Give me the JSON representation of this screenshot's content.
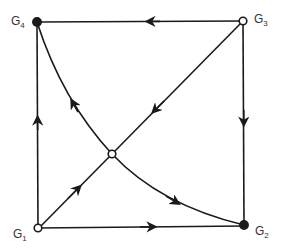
{
  "diagram": {
    "type": "directed-graph",
    "colors": {
      "stroke": "#1a1a1a",
      "label": "#333333",
      "background": "#ffffff"
    },
    "nodes": [
      {
        "id": "G1",
        "label": "G",
        "sub": "1",
        "style": "open"
      },
      {
        "id": "G2",
        "label": "G",
        "sub": "2",
        "style": "filled"
      },
      {
        "id": "G3",
        "label": "G",
        "sub": "3",
        "style": "open"
      },
      {
        "id": "G4",
        "label": "G",
        "sub": "4",
        "style": "filled"
      },
      {
        "id": "C",
        "label": "",
        "style": "open"
      }
    ],
    "edges": [
      {
        "from": "G3",
        "to": "G4"
      },
      {
        "from": "G3",
        "to": "G2"
      },
      {
        "from": "G1",
        "to": "G4"
      },
      {
        "from": "G1",
        "to": "G2"
      },
      {
        "from": "G3",
        "to": "C"
      },
      {
        "from": "G1",
        "to": "C"
      },
      {
        "from": "C",
        "to": "G4",
        "curved": true
      },
      {
        "from": "C",
        "to": "G2",
        "curved": true
      }
    ]
  }
}
